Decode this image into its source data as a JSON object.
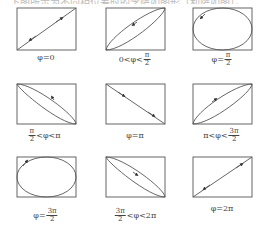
{
  "header_text": "…下图所示为不同相位差时的李萨如图形（利萨如图）。",
  "stroke_color": "#555555",
  "panels": [
    {
      "id": "phi-0",
      "label_pre": "φ=0",
      "frac_num": "",
      "frac_den": "",
      "label_post": "",
      "shape": "line-up",
      "direction": "both"
    },
    {
      "id": "phi-0-to-pi-2",
      "label_pre": "0<φ<",
      "frac_num": "π",
      "frac_den": "2",
      "label_post": "",
      "shape": "ellipse-up",
      "direction": "ccw"
    },
    {
      "id": "phi-pi-2",
      "label_pre": "φ=",
      "frac_num": "π",
      "frac_den": "2",
      "label_post": "",
      "shape": "circle",
      "direction": "ccw"
    },
    {
      "id": "phi-pi-2-to-pi",
      "label_pre": "",
      "frac_num": "π",
      "frac_den": "2",
      "label_post": "<φ<π",
      "shape": "ellipse-down",
      "direction": "ccw"
    },
    {
      "id": "phi-pi",
      "label_pre": "φ=π",
      "frac_num": "",
      "frac_den": "",
      "label_post": "",
      "shape": "line-down",
      "direction": "both"
    },
    {
      "id": "phi-pi-to-3pi-2",
      "label_pre": "π<φ<",
      "frac_num": "3π",
      "frac_den": "2",
      "label_post": "",
      "shape": "ellipse-up",
      "direction": "cw"
    },
    {
      "id": "phi-3pi-2",
      "label_pre": "φ=",
      "frac_num": "3π",
      "frac_den": "2",
      "label_post": "",
      "shape": "circle",
      "direction": "cw"
    },
    {
      "id": "phi-3pi-2-to-2pi",
      "label_pre": "",
      "frac_num": "3π",
      "frac_den": "2",
      "label_post": "<φ<2π",
      "shape": "ellipse-down",
      "direction": "cw"
    },
    {
      "id": "phi-2pi",
      "label_pre": "φ=2π",
      "frac_num": "",
      "frac_den": "",
      "label_post": "",
      "shape": "line-up",
      "direction": "both"
    }
  ]
}
